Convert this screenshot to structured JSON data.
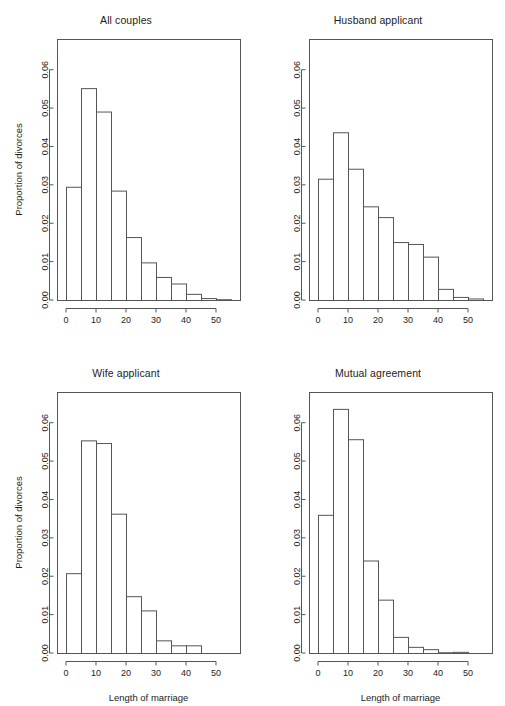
{
  "figure": {
    "layout": "2x2 panel grid",
    "width": 505,
    "height": 706,
    "background": "#ffffff",
    "line_color": "#555555",
    "text_color": "#1c1c1c"
  },
  "axes": {
    "ylabel": "Proportion of divorces",
    "xlabel": "Length of marriage",
    "y_ticks": [
      "0.00",
      "0.01",
      "0.02",
      "0.03",
      "0.04",
      "0.05",
      "0.06"
    ],
    "y_tick_values": [
      0.0,
      0.01,
      0.02,
      0.03,
      0.04,
      0.05,
      0.06
    ],
    "x_ticks": [
      "0",
      "10",
      "20",
      "30",
      "40",
      "50"
    ],
    "x_tick_values": [
      0,
      10,
      20,
      30,
      40,
      50
    ],
    "ylim": [
      0,
      0.068
    ],
    "xlim": [
      -3,
      58
    ],
    "bin_width": 5
  },
  "panels": [
    {
      "id": "all-couples",
      "title": "All couples",
      "row": 0,
      "col": 0,
      "show_ylabel": true,
      "show_xlabel": false,
      "x_tick_max": 50,
      "bin_starts": [
        0,
        5,
        10,
        15,
        20,
        25,
        30,
        35,
        40,
        45,
        50
      ],
      "values": [
        0.0295,
        0.0552,
        0.0491,
        0.0285,
        0.0164,
        0.0098,
        0.006,
        0.0043,
        0.0016,
        0.0005,
        0.0002
      ]
    },
    {
      "id": "husband-applicant",
      "title": "Husband applicant",
      "row": 0,
      "col": 1,
      "show_ylabel": false,
      "show_xlabel": false,
      "x_tick_max": 50,
      "bin_starts": [
        0,
        5,
        10,
        15,
        20,
        25,
        30,
        35,
        40,
        45,
        50
      ],
      "values": [
        0.0316,
        0.0437,
        0.0342,
        0.0244,
        0.0216,
        0.0151,
        0.0146,
        0.0113,
        0.0029,
        0.0008,
        0.0004
      ]
    },
    {
      "id": "wife-applicant",
      "title": "Wife applicant",
      "row": 1,
      "col": 0,
      "show_ylabel": true,
      "show_xlabel": true,
      "x_tick_max": 50,
      "bin_starts": [
        0,
        5,
        10,
        15,
        20,
        25,
        30,
        35,
        40
      ],
      "values": [
        0.0208,
        0.0554,
        0.0547,
        0.0363,
        0.0148,
        0.0111,
        0.0033,
        0.002,
        0.002
      ]
    },
    {
      "id": "mutual-agreement",
      "title": "Mutual agreement",
      "row": 1,
      "col": 1,
      "show_ylabel": false,
      "show_xlabel": true,
      "x_tick_max": 50,
      "bin_starts": [
        0,
        5,
        10,
        15,
        20,
        25,
        30,
        35,
        40,
        45
      ],
      "values": [
        0.036,
        0.0636,
        0.0557,
        0.0241,
        0.0139,
        0.0042,
        0.0016,
        0.001,
        0.0002,
        0.0003
      ]
    }
  ],
  "chart_data": {
    "type": "bar",
    "title": "",
    "subtitle": "",
    "xlabel": "Length of marriage",
    "ylabel": "Proportion of divorces",
    "xlim": [
      -3,
      58
    ],
    "ylim": [
      0,
      0.068
    ],
    "grid": false,
    "legend": "none",
    "bin_width": 5,
    "categories": [
      "0-5",
      "5-10",
      "10-15",
      "15-20",
      "20-25",
      "25-30",
      "30-35",
      "35-40",
      "40-45",
      "45-50",
      "50-55"
    ],
    "series": [
      {
        "name": "All couples",
        "values": [
          0.0295,
          0.0552,
          0.0491,
          0.0285,
          0.0164,
          0.0098,
          0.006,
          0.0043,
          0.0016,
          0.0005,
          0.0002
        ]
      },
      {
        "name": "Husband applicant",
        "values": [
          0.0316,
          0.0437,
          0.0342,
          0.0244,
          0.0216,
          0.0151,
          0.0146,
          0.0113,
          0.0029,
          0.0008,
          0.0004
        ]
      },
      {
        "name": "Wife applicant",
        "values": [
          0.0208,
          0.0554,
          0.0547,
          0.0363,
          0.0148,
          0.0111,
          0.0033,
          0.002,
          0.002,
          null,
          null
        ]
      },
      {
        "name": "Mutual agreement",
        "values": [
          0.036,
          0.0636,
          0.0557,
          0.0241,
          0.0139,
          0.0042,
          0.0016,
          0.001,
          0.0002,
          0.0003,
          null
        ]
      }
    ],
    "x_tick_labels": [
      "0",
      "10",
      "20",
      "30",
      "40",
      "50"
    ],
    "y_tick_labels": [
      "0.00",
      "0.01",
      "0.02",
      "0.03",
      "0.04",
      "0.05",
      "0.06"
    ]
  }
}
